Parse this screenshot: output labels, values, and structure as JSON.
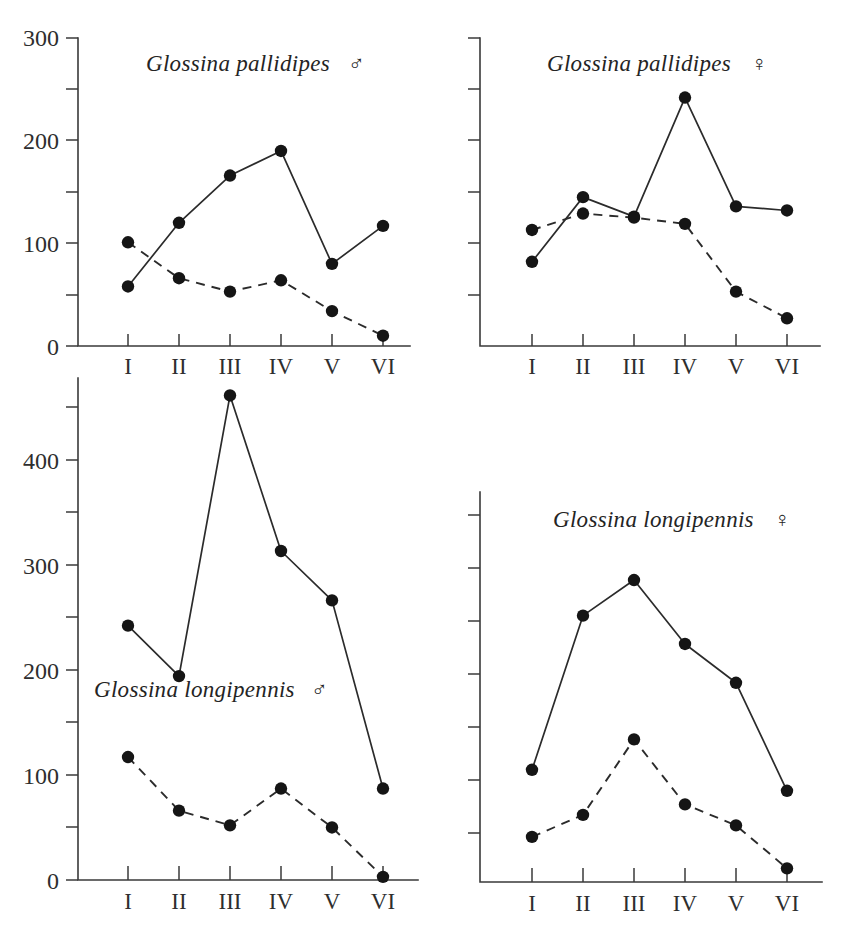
{
  "figure": {
    "background_color": "#ffffff",
    "ink_color": "#222222",
    "panel_count": 4
  },
  "legend": {
    "solid_series_name": "Seasonal catch (solid line)",
    "dashed_series_name": "Seasonal catch (dashed line)",
    "marker_shape": "filled-circle"
  },
  "symbols": {
    "male": "♂",
    "female": "♀"
  },
  "chart_data": [
    {
      "type": "line",
      "panel": "top-left",
      "title": "Glossina pallidipes",
      "sex": "♂",
      "categories": [
        "I",
        "II",
        "III",
        "IV",
        "V",
        "VI"
      ],
      "xlabel": "",
      "ylabel": "",
      "ylim": [
        0,
        300
      ],
      "yticks": [
        0,
        50,
        100,
        150,
        200,
        250,
        300
      ],
      "ytick_labels": [
        "0",
        "",
        "100",
        "",
        "200",
        "",
        "300"
      ],
      "grid": false,
      "legend_position": "none",
      "series": [
        {
          "name": "solid",
          "style": "solid",
          "values": [
            58,
            120,
            166,
            190,
            80,
            117
          ]
        },
        {
          "name": "dashed",
          "style": "dashed",
          "values": [
            101,
            66,
            53,
            64,
            34,
            10
          ]
        }
      ]
    },
    {
      "type": "line",
      "panel": "top-right",
      "title": "Glossina pallidipes",
      "sex": "♀",
      "categories": [
        "I",
        "II",
        "III",
        "IV",
        "V",
        "VI"
      ],
      "xlabel": "",
      "ylabel": "",
      "ylim": [
        0,
        300
      ],
      "yticks": [
        0,
        50,
        100,
        150,
        200,
        250,
        300
      ],
      "ytick_labels": [
        "",
        "",
        "",
        "",
        "",
        "",
        ""
      ],
      "grid": false,
      "legend_position": "none",
      "series": [
        {
          "name": "solid",
          "style": "solid",
          "values": [
            82,
            145,
            126,
            242,
            136,
            132
          ]
        },
        {
          "name": "dashed",
          "style": "dashed",
          "values": [
            113,
            129,
            125,
            119,
            53,
            27
          ]
        }
      ]
    },
    {
      "type": "line",
      "panel": "bottom-left",
      "title": "Glossina longipennis",
      "sex": "♂",
      "categories": [
        "I",
        "II",
        "III",
        "IV",
        "V",
        "VI"
      ],
      "xlabel": "",
      "ylabel": "",
      "ylim": [
        0,
        475
      ],
      "yticks": [
        0,
        50,
        100,
        150,
        200,
        250,
        300,
        350,
        400,
        450
      ],
      "ytick_labels": [
        "0",
        "",
        "100",
        "",
        "200",
        "",
        "300",
        "",
        "400",
        ""
      ],
      "grid": false,
      "legend_position": "none",
      "series": [
        {
          "name": "solid",
          "style": "solid",
          "values": [
            242,
            194,
            461,
            313,
            266,
            87
          ]
        },
        {
          "name": "dashed",
          "style": "dashed",
          "values": [
            117,
            66,
            52,
            87,
            50,
            3
          ]
        }
      ]
    },
    {
      "type": "line",
      "panel": "bottom-right",
      "title": "Glossina longipennis",
      "sex": "♀",
      "categories": [
        "I",
        "II",
        "III",
        "IV",
        "V",
        "VI"
      ],
      "xlabel": "",
      "ylabel": "",
      "ylim": [
        0,
        350
      ],
      "yticks": [
        0,
        50,
        100,
        150,
        200,
        250,
        300,
        350
      ],
      "ytick_labels": [
        "",
        "",
        "",
        "",
        "",
        "",
        "",
        ""
      ],
      "grid": false,
      "legend_position": "none",
      "series": [
        {
          "name": "solid",
          "style": "solid",
          "values": [
            107,
            254,
            288,
            227,
            190,
            87
          ]
        },
        {
          "name": "dashed",
          "style": "dashed",
          "values": [
            43,
            64,
            136,
            74,
            54,
            13
          ]
        }
      ]
    }
  ]
}
